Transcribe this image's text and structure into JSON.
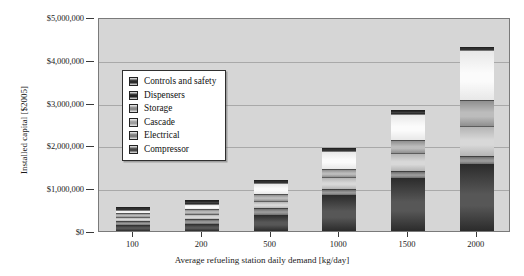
{
  "chart_data": {
    "type": "bar",
    "subtype": "stacked-bar",
    "title": "",
    "xlabel": "Average refueling station daily demand [kg/day]",
    "ylabel": "Installed capital [$2005]",
    "categories": [
      "100",
      "200",
      "500",
      "1000",
      "1500",
      "2000"
    ],
    "ylim": [
      0,
      5000000
    ],
    "ytick_labels": [
      "$0",
      "$1,000,000",
      "$2,000,000",
      "$3,000,000",
      "$4,000,000",
      "$5,000,000"
    ],
    "ytick_values": [
      0,
      1000000,
      2000000,
      3000000,
      4000000,
      5000000
    ],
    "grid": true,
    "legend_position": "upper-left-inside",
    "stack_order_bottom_to_top": [
      "Compressor",
      "Electrical",
      "Cascade",
      "Storage",
      "Dispensers",
      "Controls and safety"
    ],
    "series": [
      {
        "name": "Compressor",
        "color": "#2b2b2b",
        "color_light": "#575757",
        "values": [
          150000,
          175000,
          380000,
          830000,
          1230000,
          1560000
        ]
      },
      {
        "name": "Electrical",
        "color": "#6e6e6e",
        "color_light": "#9a9a9a",
        "values": [
          95000,
          110000,
          150000,
          160000,
          170000,
          190000
        ]
      },
      {
        "name": "Cascade",
        "color": "#b4b4b4",
        "color_light": "#d8d8d8",
        "values": [
          90000,
          105000,
          170000,
          270000,
          430000,
          700000
        ]
      },
      {
        "name": "Storage",
        "color": "#8f8f8f",
        "color_light": "#bcbcbc",
        "values": [
          80000,
          120000,
          170000,
          180000,
          300000,
          600000
        ]
      },
      {
        "name": "Dispensers",
        "color": "#e8e8e8",
        "color_light": "#fbfbfb",
        "values": [
          85000,
          130000,
          240000,
          440000,
          610000,
          1170000
        ]
      },
      {
        "name": "Controls and safety",
        "color": "#1c1c1c",
        "color_light": "#3f3f3f",
        "values": [
          50000,
          80000,
          90000,
          70000,
          80000,
          80000
        ]
      }
    ],
    "totals": [
      550000,
      720000,
      1200000,
      1950000,
      2820000,
      4300000
    ],
    "legend": [
      {
        "label": "Controls and safety",
        "color": "#2b2b2b"
      },
      {
        "label": "Dispensers",
        "color": "#232323"
      },
      {
        "label": "Storage",
        "color": "#8a8a8a"
      },
      {
        "label": "Cascade",
        "color": "#9e9e9e"
      },
      {
        "label": "Electrical",
        "color": "#7e7e7e"
      },
      {
        "label": "Compressor",
        "color": "#474747"
      }
    ]
  }
}
